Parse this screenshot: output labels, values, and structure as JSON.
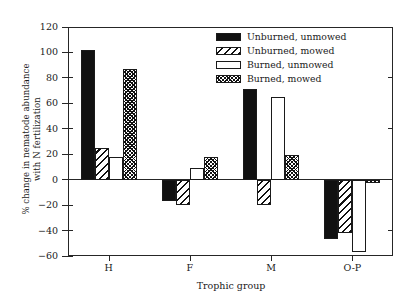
{
  "chart_data": {
    "type": "bar",
    "title": "",
    "xlabel": "Trophic group",
    "ylabel": "% change in nematode abundance with N fertilization",
    "ylabel_line1": "% change in nematode abundance",
    "ylabel_line2": "with N fertilization",
    "categories": [
      "H",
      "F",
      "M",
      "O-P"
    ],
    "ylim": [
      -60,
      120
    ],
    "yticks": [
      -60,
      -40,
      -20,
      0,
      20,
      40,
      60,
      80,
      100,
      120
    ],
    "ytick_labels": [
      "−60",
      "−40",
      "−20",
      "0",
      "20",
      "40",
      "60",
      "80",
      "100",
      "120"
    ],
    "grid": false,
    "legend_position": "top-right",
    "series": [
      {
        "name": "Unburned, unmowed",
        "pattern": "solid-black",
        "values": [
          102,
          -17,
          71,
          -47
        ]
      },
      {
        "name": "Unburned, mowed",
        "pattern": "diagonal-hatch",
        "values": [
          25,
          -20,
          -20,
          -42
        ]
      },
      {
        "name": "Burned, unmowed",
        "pattern": "white-empty",
        "values": [
          18,
          9,
          65,
          -57
        ]
      },
      {
        "name": "Burned, mowed",
        "pattern": "dense-crosshatch",
        "values": [
          87,
          18,
          19,
          -3
        ]
      }
    ]
  },
  "colors": {
    "axis": "#262626",
    "bar_solid": "#111111",
    "bar_white": "#ffffff",
    "background": "#ffffff"
  }
}
